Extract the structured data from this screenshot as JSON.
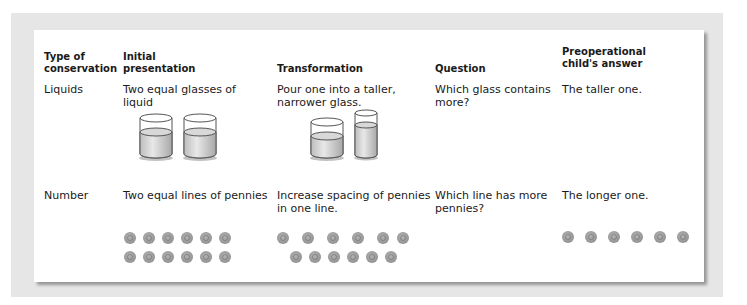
{
  "table": {
    "headers": [
      {
        "text": "Type of\nconservation"
      },
      {
        "text": "Initial\npresentation"
      },
      {
        "text": "Transformation"
      },
      {
        "text": "Question"
      },
      {
        "text": "Preoperational\nchild's answer"
      }
    ],
    "rows": [
      {
        "type": "Liquids",
        "initial": "Two equal glasses of\nliquid",
        "transformation": "Pour one into a taller,\nnarrower glass.",
        "question": "Which glass contains\nmore?",
        "answer": "The taller one.",
        "illustration": {
          "initial": {
            "icon": "two-equal-glasses-icon",
            "glasses": 2
          },
          "transformation": {
            "icon": "short-and-tall-glass-icon",
            "glasses": 2
          }
        }
      },
      {
        "type": "Number",
        "initial": "Two equal lines of pennies",
        "transformation": "Increase spacing of pennies\nin one line.",
        "question": "Which line has more\npennies?",
        "answer": "The longer one.",
        "illustration": {
          "initial": {
            "icon": "penny-icon",
            "rows": [
              6,
              6
            ]
          },
          "transformation": {
            "icon": "penny-icon",
            "rows": [
              6,
              6
            ]
          },
          "answer": {
            "icon": "penny-icon",
            "rows": [
              6
            ]
          }
        }
      }
    ]
  },
  "colors": {
    "frame": "#e6e6e6",
    "card": "#ffffff",
    "penny": "#9a9a9a",
    "liquid": "#d4d4d4"
  }
}
